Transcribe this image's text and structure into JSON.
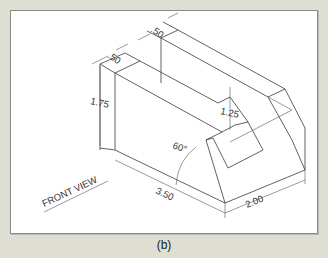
{
  "figure": {
    "caption": "(b)",
    "view_label": "FRONT VIEW",
    "dimensions": {
      "top_thickness_left": ".50",
      "top_thickness_right": ".50",
      "height_left": "1.75",
      "height_right_slot": "1.25",
      "angle": "60°",
      "length": "3.50",
      "depth": "2.00"
    }
  },
  "colors": {
    "background": "#dedfd2",
    "paper": "#ffffff",
    "linework": "#3a3a3a"
  }
}
